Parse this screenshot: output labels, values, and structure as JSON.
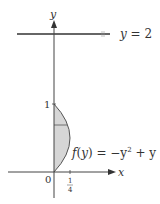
{
  "diagram": {
    "axes": {
      "x_label": "x",
      "y_label": "y",
      "origin_label": "0",
      "y_tick_label": "1",
      "x_tick_label_num": "1",
      "x_tick_label_den": "4"
    },
    "line": {
      "label_var": "y",
      "label_eq": " = 2"
    },
    "curve": {
      "label_f": "f",
      "label_open": "(",
      "label_var": "y",
      "label_close": ")",
      "label_rhs": " = −y",
      "label_exp": "2",
      "label_tail": " + y"
    },
    "colors": {
      "axis": "#333333",
      "fill": "#d9d9d9",
      "curve": "#555555"
    }
  }
}
